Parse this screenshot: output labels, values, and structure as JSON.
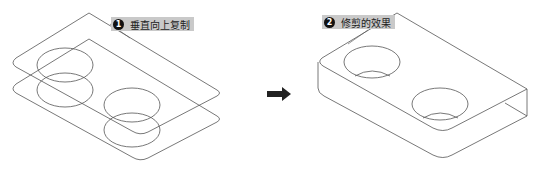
{
  "steps": [
    {
      "number": "1",
      "label": "垂直向上复制"
    },
    {
      "number": "2",
      "label": "修剪的效果"
    }
  ],
  "arrow": {
    "icon": "right-arrow-icon"
  },
  "colors": {
    "line": "#555555",
    "label_bg": "#c9c9c9",
    "badge": "#111111"
  }
}
